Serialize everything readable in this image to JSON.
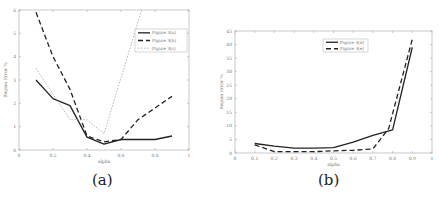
{
  "chart_data": [
    {
      "id": "a",
      "type": "line",
      "caption": "(a)",
      "title": "",
      "xlabel": "alpha",
      "ylabel": "Region Error %",
      "xlim": [
        0,
        1
      ],
      "ylim": [
        0,
        6
      ],
      "xticks": [
        0,
        0.2,
        0.4,
        0.6,
        0.8,
        1
      ],
      "xtick_labels": [
        "0",
        "0.2",
        "0.4",
        "0.6",
        "0.8",
        "1"
      ],
      "yticks": [
        0,
        1,
        2,
        3,
        4,
        5,
        6
      ],
      "ytick_labels": [
        "0",
        "1",
        "2",
        "3",
        "4",
        "5",
        "6"
      ],
      "grid": false,
      "legend_position": "upper right",
      "series": [
        {
          "name": "Figure 3(a)",
          "style": "solid",
          "color": "#222222",
          "x": [
            0.1,
            0.2,
            0.3,
            0.4,
            0.5,
            0.6,
            0.7,
            0.8,
            0.9
          ],
          "values": [
            3.0,
            2.2,
            1.9,
            0.55,
            0.25,
            0.45,
            0.45,
            0.45,
            0.6
          ]
        },
        {
          "name": "Figure 3(b)",
          "style": "dashed",
          "color": "#222222",
          "x": [
            0.1,
            0.2,
            0.3,
            0.4,
            0.5,
            0.6,
            0.7,
            0.8,
            0.9
          ],
          "values": [
            5.9,
            4.0,
            2.6,
            0.6,
            0.35,
            0.45,
            1.3,
            1.8,
            2.3
          ]
        },
        {
          "name": "Figure 3(c)",
          "style": "dotted",
          "color": "#aaaaaa",
          "x": [
            0.1,
            0.3,
            0.4,
            0.5,
            0.73
          ],
          "values": [
            3.5,
            1.3,
            1.3,
            0.7,
            6.2
          ]
        }
      ]
    },
    {
      "id": "b",
      "type": "line",
      "caption": "(b)",
      "title": "",
      "xlabel": "alpha",
      "ylabel": "Region Error %",
      "xlim": [
        0,
        1
      ],
      "ylim": [
        0,
        45
      ],
      "xticks": [
        0,
        0.1,
        0.2,
        0.3,
        0.4,
        0.5,
        0.6,
        0.7,
        0.8,
        0.9,
        1
      ],
      "xtick_labels": [
        "0",
        "0.1",
        "0.2",
        "0.3",
        "0.4",
        "0.5",
        "0.6",
        "0.7",
        "0.8",
        "0.9",
        "1"
      ],
      "yticks": [
        0,
        5,
        10,
        15,
        20,
        25,
        30,
        35,
        40,
        45
      ],
      "ytick_labels": [
        "0",
        "5",
        "10",
        "15",
        "20",
        "25",
        "30",
        "35",
        "40",
        "45"
      ],
      "grid": false,
      "legend_position": "upper center",
      "series": [
        {
          "name": "Figure 3(d)",
          "style": "solid",
          "color": "#222222",
          "x": [
            0.1,
            0.2,
            0.3,
            0.4,
            0.5,
            0.6,
            0.7,
            0.8,
            0.9
          ],
          "values": [
            3.5,
            2.5,
            1.8,
            1.8,
            2.0,
            4.0,
            6.5,
            8.5,
            39
          ]
        },
        {
          "name": "Figure 3(e)",
          "style": "dashed",
          "color": "#222222",
          "x": [
            0.1,
            0.2,
            0.3,
            0.4,
            0.5,
            0.6,
            0.7,
            0.78,
            0.9
          ],
          "values": [
            3.0,
            0.5,
            0.5,
            0.5,
            0.8,
            1.0,
            1.5,
            9.0,
            42
          ]
        }
      ]
    }
  ]
}
